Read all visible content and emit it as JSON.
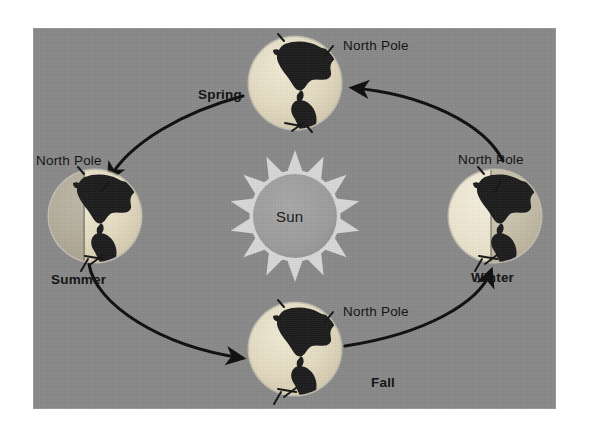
{
  "figure": {
    "background_color": "#ffffff",
    "panel_color": "#898989"
  },
  "sun": {
    "label": "Sun",
    "body_color": "#9a9a9a",
    "ray_color": "#d8d8d8",
    "ray_count": 14,
    "center": {
      "x": 262,
      "y": 188
    },
    "radius": 46
  },
  "orbit": {
    "center": {
      "x": 262,
      "y": 188
    },
    "radius_x": 200,
    "radius_y": 133,
    "color": "#0d0d0d",
    "direction": "counterclockwise"
  },
  "pole_label": "North Pole",
  "earths": [
    {
      "season": "Spring",
      "pole_label": "North Pole",
      "position": {
        "x": 262,
        "y": 55
      },
      "radius": 46,
      "lit_side": "full",
      "tilt_deg": 23.5
    },
    {
      "season": "Summer",
      "pole_label": "North Pole",
      "position": {
        "x": 62,
        "y": 188
      },
      "radius": 46,
      "lit_side": "right",
      "tilt_deg": 23.5
    },
    {
      "season": "Fall",
      "pole_label": "North Pole",
      "position": {
        "x": 262,
        "y": 321
      },
      "radius": 46,
      "lit_side": "full",
      "tilt_deg": 23.5
    },
    {
      "season": "Winter",
      "pole_label": "North Pole",
      "position": {
        "x": 462,
        "y": 188
      },
      "radius": 46,
      "lit_side": "left",
      "tilt_deg": 23.5
    }
  ],
  "labels": {
    "spring": "Spring",
    "summer": "Summer",
    "fall": "Fall",
    "winter": "Winter",
    "north_pole_spring": "North Pole",
    "north_pole_summer": "North Pole",
    "north_pole_fall": "North Pole",
    "north_pole_winter": "North Pole",
    "sun": "Sun"
  },
  "arrows": [
    {
      "name": "winter-to-spring",
      "points_to": "Spring"
    },
    {
      "name": "spring-to-summer",
      "points_to": "Summer"
    },
    {
      "name": "summer-to-fall",
      "points_to": "Fall"
    },
    {
      "name": "fall-to-winter",
      "points_to": "Winter"
    }
  ]
}
